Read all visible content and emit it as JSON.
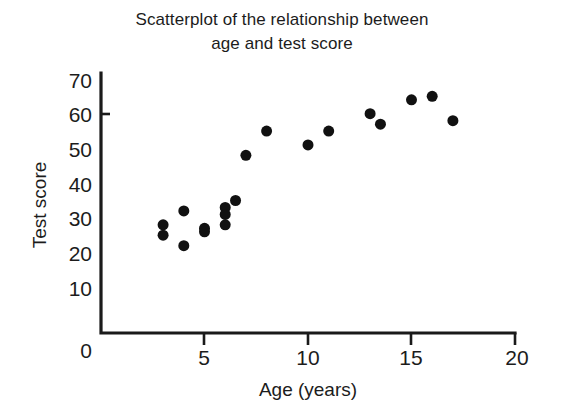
{
  "chart_data": {
    "type": "scatter",
    "title": "Scatterplot of the relationship between age and test score",
    "title_line1": "Scatterplot of the relationship between",
    "title_line2": "age and test score",
    "xlabel": "Age (years)",
    "ylabel": "Test score",
    "xlim": [
      0,
      20
    ],
    "ylim": [
      0,
      70
    ],
    "xticks": [
      0,
      5,
      10,
      15,
      20
    ],
    "yticks": [
      0,
      10,
      20,
      30,
      40,
      50,
      60,
      70
    ],
    "xtick_labels": [
      "0",
      "5",
      "10",
      "15",
      "20"
    ],
    "ytick_labels": [
      "0",
      "10",
      "20",
      "30",
      "40",
      "50",
      "60",
      "70"
    ],
    "grid": false,
    "legend": false,
    "marker": "filled-circle",
    "marker_color": "#111111",
    "marker_size": 11,
    "series": [
      {
        "name": "age vs test score",
        "x": [
          3,
          3,
          4,
          4,
          5,
          5,
          6,
          6,
          6,
          6.5,
          7,
          8,
          10,
          11,
          13,
          13.5,
          15,
          16,
          17
        ],
        "y": [
          28,
          25,
          32,
          22,
          26,
          27,
          33,
          31,
          28,
          35,
          48,
          55,
          51,
          55,
          60,
          57,
          64,
          65,
          58
        ]
      }
    ],
    "n_points": 19
  },
  "figure": {
    "background": "#ffffff",
    "axis_color": "#1a1a1a"
  }
}
